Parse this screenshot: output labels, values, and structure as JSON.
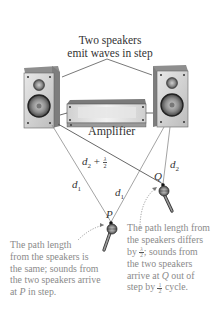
{
  "title": {
    "line1": "Two speakers",
    "line2": "emit waves in step"
  },
  "amplifier": {
    "label": "Amplifier"
  },
  "labels": {
    "d1_left": "d",
    "d1_left_sub": "1",
    "d1_right": "d",
    "d1_right_sub": "1",
    "d2": "d",
    "d2_sub": "2",
    "d2_plus": "d",
    "d2_plus_sub": "2",
    "plus": " + ",
    "lambda": "λ",
    "two": "2",
    "point_p": "P",
    "point_q": "Q"
  },
  "captions": {
    "left": {
      "line1": "The path length",
      "line2": "from the speakers is",
      "line3": "the same; sounds from",
      "line4": "the two speakers arrive",
      "line5_prefix": "at ",
      "line5_var": "P",
      "line5_suffix": " in step."
    },
    "right": {
      "line1": "The path length from",
      "line2": "the speakers differs",
      "line3_prefix": "by ",
      "line3_num": "λ",
      "line3_den": "2",
      "line3_suffix": "; sounds from",
      "line4": "the two speakers",
      "line5_prefix": "arrive at ",
      "line5_var": "Q",
      "line5_suffix": " out of",
      "line6_prefix": "step by ",
      "line6_num": "1",
      "line6_den": "2",
      "line6_suffix": " cycle."
    }
  },
  "colors": {
    "line": "#555555",
    "caption": "#8a8a8a",
    "speaker_face": "#d6d6d6",
    "speaker_side": "#9a9a9a"
  }
}
